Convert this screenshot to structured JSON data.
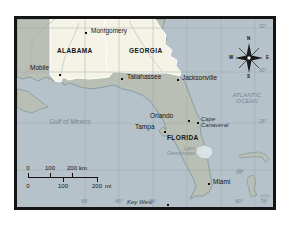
{
  "region_map": {
    "states": {
      "alabama": "ALABAMA",
      "georgia": "GEORGIA",
      "florida": "FLORIDA"
    },
    "cities": {
      "montgomery": "Montgomery",
      "mobile": "Mobile",
      "tallahassee": "Tallahassee",
      "jacksonville": "Jacksonville",
      "orlando": "Orlando",
      "tampa": "Tampa",
      "miami": "Miami",
      "key_west": "Key West"
    },
    "features": {
      "cape_line1": "Cape",
      "cape_line2": "Canaveral",
      "lake_line1": "Lake",
      "lake_line2": "Okeechobee",
      "gulf": "Gulf of Mexico",
      "atlantic_line1": "ATLANTIC",
      "atlantic_line2": "OCEAN"
    },
    "compass": {
      "north": "N",
      "south": "S",
      "east": "E",
      "west": "W"
    },
    "scale_bar": {
      "km": {
        "t0": "0",
        "t1": "100",
        "t2": "200",
        "unit": "km"
      },
      "mi": {
        "t0": "0",
        "t1": "100",
        "t2": "200",
        "unit": "mi"
      }
    },
    "graticule": {
      "lat_32": "32°",
      "lat_30": "30°",
      "lat_28": "28°",
      "lat_26": "26°",
      "lon_88": "88°",
      "lon_86": "86°",
      "lon_84": "84°",
      "lon_80": "80°",
      "lon_78": "78°"
    },
    "colors": {
      "water": "#b5c2c9",
      "land": "#b9bfb4",
      "highlight_states": "#f4f3e6",
      "lake": "#d9e3e6",
      "coastline": "#7c939b"
    }
  }
}
